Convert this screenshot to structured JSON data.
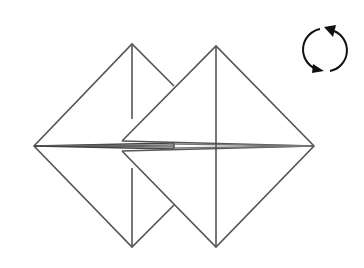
{
  "diagram": {
    "type": "origami-fold-step",
    "description": "Two overlapping square bases viewed as diamonds with a turn-over symbol",
    "stroke_color": "#555555",
    "dark_stroke_color": "#333333",
    "symbol_color": "#111111",
    "background": "#ffffff",
    "symbol": {
      "name": "turn-over",
      "center": [
        325,
        50
      ],
      "radius": 21
    },
    "left_diamond": {
      "top": [
        132,
        44
      ],
      "right_cut": [
        174,
        86
      ],
      "bottom": [
        132,
        247
      ],
      "left": [
        34,
        146
      ]
    },
    "right_diamond": {
      "top": [
        216,
        46
      ],
      "right": [
        314,
        146
      ],
      "bottom": [
        216,
        247
      ],
      "notch_top": [
        122,
        141
      ],
      "notch_bottom": [
        122,
        151
      ]
    }
  }
}
